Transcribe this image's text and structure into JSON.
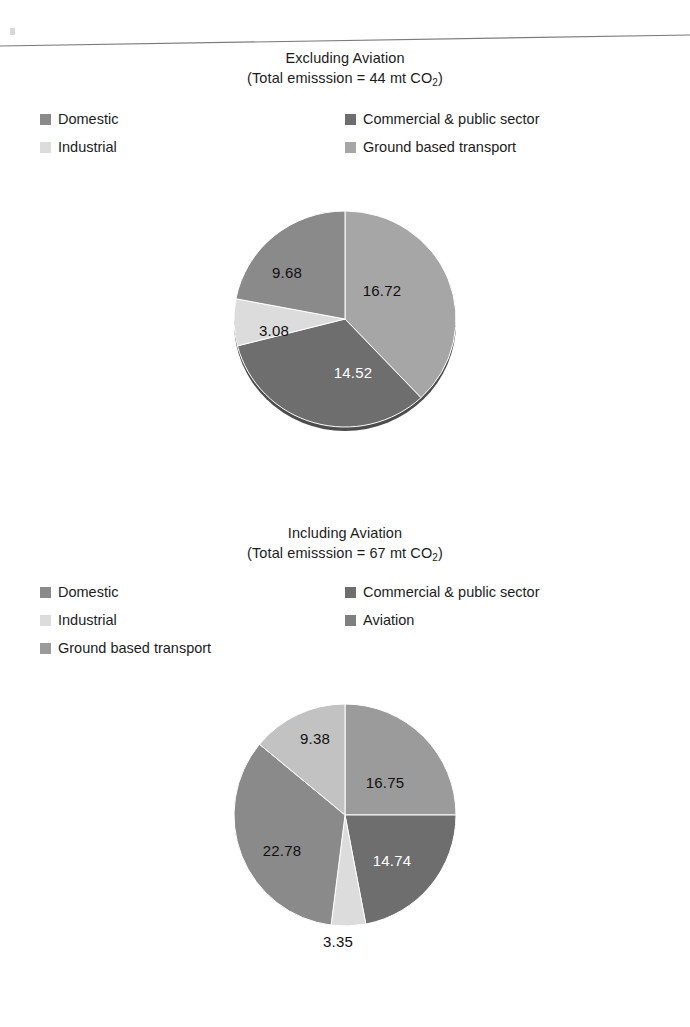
{
  "page": {
    "background": "#ffffff",
    "artifact": "scan-line"
  },
  "charts": [
    {
      "id": "excluding-aviation",
      "title_line1": "Excluding Aviation",
      "title_line2_pre": "(Total emisssion = 44 mt CO",
      "title_sub": "2",
      "title_line2_post": ")",
      "legend": [
        {
          "label": "Domestic",
          "color": "#8a8a8a",
          "col": "a",
          "row": 0
        },
        {
          "label": "Industrial",
          "color": "#dcdcdc",
          "col": "a",
          "row": 1
        },
        {
          "label": "Commercial & public sector",
          "color": "#6e6e6e",
          "col": "b",
          "row": 0
        },
        {
          "label": "Ground based transport",
          "color": "#a6a6a6",
          "col": "b",
          "row": 1
        }
      ],
      "chart_data": {
        "type": "pie",
        "title": "Excluding Aviation (Total emisssion = 44 mt CO2)",
        "unit": "mt CO2",
        "total": 44,
        "legend_position": "top",
        "categories": [
          "Ground based transport",
          "Commercial & public sector",
          "Industrial",
          "Domestic"
        ],
        "values": [
          16.72,
          14.52,
          3.08,
          9.68
        ],
        "colors": [
          "#a6a6a6",
          "#6e6e6e",
          "#dcdcdc",
          "#8a8a8a"
        ],
        "labels": [
          "16.72",
          "14.52",
          "3.08",
          "9.68"
        ],
        "label_colors": [
          "dark",
          "light",
          "dark",
          "dark"
        ],
        "start_angle_deg": 0,
        "direction": "clockwise"
      }
    },
    {
      "id": "including-aviation",
      "title_line1": "Including Aviation",
      "title_line2_pre": "(Total emisssion = 67 mt CO",
      "title_sub": "2",
      "title_line2_post": ")",
      "legend": [
        {
          "label": "Domestic",
          "color": "#8a8a8a",
          "col": "a",
          "row": 0
        },
        {
          "label": "Industrial",
          "color": "#dcdcdc",
          "col": "a",
          "row": 1
        },
        {
          "label": "Ground based transport",
          "color": "#9b9b9b",
          "col": "a",
          "row": 2
        },
        {
          "label": "Commercial & public sector",
          "color": "#6e6e6e",
          "col": "b",
          "row": 0
        },
        {
          "label": "Aviation",
          "color": "#7f7f7f",
          "col": "b",
          "row": 1
        }
      ],
      "chart_data": {
        "type": "pie",
        "title": "Including Aviation (Total emisssion = 67 mt CO2)",
        "unit": "mt CO2",
        "total": 67,
        "legend_position": "top",
        "categories": [
          "Domestic",
          "Commercial & public sector",
          "Industrial",
          "Ground based transport",
          "Aviation"
        ],
        "values": [
          16.75,
          14.74,
          3.35,
          22.78,
          9.38
        ],
        "colors": [
          "#9b9b9b",
          "#6e6e6e",
          "#dcdcdc",
          "#8a8a8a",
          "#c2c2c2"
        ],
        "labels": [
          "16.75",
          "14.74",
          "3.35",
          "22.78",
          "9.38"
        ],
        "label_colors": [
          "dark",
          "light",
          "dark",
          "dark",
          "dark"
        ],
        "start_angle_deg": 0,
        "direction": "clockwise"
      }
    }
  ]
}
